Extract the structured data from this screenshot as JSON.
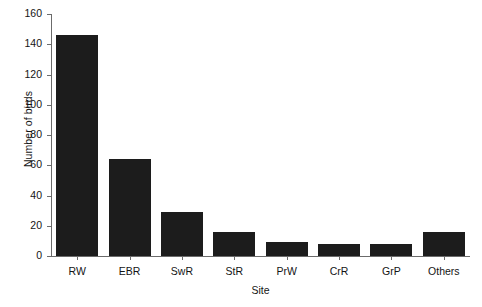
{
  "chart_data": {
    "type": "bar",
    "title": "",
    "xlabel": "Site",
    "ylabel": "Number of birds",
    "categories": [
      "RW",
      "EBR",
      "SwR",
      "StR",
      "PrW",
      "CrR",
      "GrP",
      "Others"
    ],
    "values": [
      146,
      64,
      29,
      16,
      9,
      8,
      8,
      16
    ],
    "ylim": [
      0,
      160
    ],
    "yticks": [
      0,
      20,
      40,
      60,
      80,
      100,
      120,
      140,
      160
    ],
    "ytick_labels": [
      "0",
      "20",
      "40",
      "60",
      "80",
      "100",
      "120",
      "140",
      "160"
    ],
    "grid": false,
    "legend": null,
    "bar_color": "#1c1c1c",
    "background_color": "#ffffff",
    "axis_color": "#6b6b6b"
  }
}
